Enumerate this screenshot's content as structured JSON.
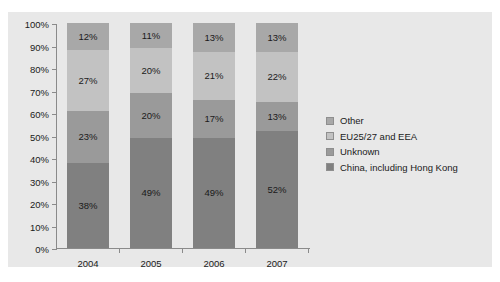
{
  "top_clipped_caption": "",
  "chart_data": {
    "type": "bar",
    "subtype": "100% stacked bar",
    "title": "",
    "xlabel": "",
    "ylabel": "",
    "ylim": [
      0,
      100
    ],
    "grid": false,
    "legend_position": "right",
    "categories": [
      "2004",
      "2005",
      "2006",
      "2007"
    ],
    "y_ticks": [
      "0%",
      "10%",
      "20%",
      "30%",
      "40%",
      "50%",
      "60%",
      "70%",
      "80%",
      "90%",
      "100%"
    ],
    "series": [
      {
        "name": "China, including Hong Kong",
        "color": "#808080",
        "values": [
          38,
          49,
          49,
          52
        ],
        "labels": [
          "38%",
          "49%",
          "49%",
          "52%"
        ]
      },
      {
        "name": "Unknown",
        "color": "#9a9a9a",
        "values": [
          23,
          20,
          17,
          13
        ],
        "labels": [
          "23%",
          "20%",
          "17%",
          "13%"
        ]
      },
      {
        "name": "EU25/27 and EEA",
        "color": "#c2c2c2",
        "values": [
          27,
          20,
          21,
          22
        ],
        "labels": [
          "27%",
          "20%",
          "21%",
          "22%"
        ]
      },
      {
        "name": "Other",
        "color": "#a8a8a8",
        "values": [
          12,
          11,
          13,
          13
        ],
        "labels": [
          "12%",
          "11%",
          "13%",
          "13%"
        ]
      }
    ]
  },
  "legend": {
    "items": [
      {
        "label": "Other",
        "color": "#a8a8a8"
      },
      {
        "label": "EU25/27 and EEA",
        "color": "#c2c2c2"
      },
      {
        "label": "Unknown",
        "color": "#9a9a9a"
      },
      {
        "label": "China, including Hong Kong",
        "color": "#808080"
      }
    ]
  },
  "colors": {
    "plot_background": "#e8e8e8",
    "page_background": "#ffffff",
    "axis": "#8a8a8a",
    "text": "#1a1a1a"
  }
}
